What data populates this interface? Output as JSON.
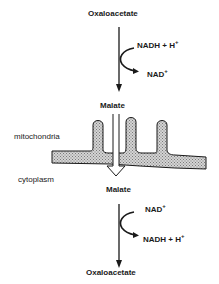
{
  "diagram": {
    "mitochondria_side": {
      "compartment_label": "mitochondria",
      "substrate": "Oxaloacetate",
      "cofactor_in": {
        "base": "NADH + H",
        "sup": "+"
      },
      "cofactor_out": {
        "base": "NAD",
        "sup": "+"
      },
      "product": "Malate"
    },
    "cytoplasm_side": {
      "compartment_label": "cytoplasm",
      "substrate": "Malate",
      "cofactor_in": {
        "base": "NAD",
        "sup": "+"
      },
      "cofactor_out": {
        "base": "NADH + H",
        "sup": "+"
      },
      "product": "Oxaloacetate"
    }
  }
}
